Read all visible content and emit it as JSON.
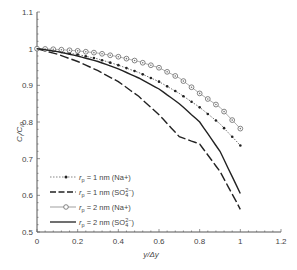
{
  "chart_data": {
    "type": "line",
    "title": "",
    "xlabel": "y/Δy",
    "ylabel": "C_i/C_i0",
    "xlim": [
      0,
      1.2
    ],
    "ylim": [
      0.5,
      1.1
    ],
    "xticks": [
      "0",
      "0.2",
      "0.4",
      "0.6",
      "0.8",
      "1",
      "1.2"
    ],
    "yticks": [
      "0.5",
      "0.6",
      "0.7",
      "0.8",
      "0.9",
      "1",
      "1.1"
    ],
    "grid": false,
    "legend_position": "lower left",
    "x": [
      0,
      0.1,
      0.2,
      0.3,
      0.4,
      0.5,
      0.6,
      0.7,
      0.8,
      0.9,
      1.0
    ],
    "series": [
      {
        "name": "r_p = 1 nm (Na+)",
        "style": "dotted-filled-dots",
        "values": [
          1.0,
          0.993,
          0.984,
          0.972,
          0.955,
          0.935,
          0.91,
          0.878,
          0.84,
          0.795,
          0.736
        ]
      },
      {
        "name": "r_p = 1 nm (SO4 2-)",
        "style": "dashed",
        "values": [
          1.0,
          0.985,
          0.965,
          0.94,
          0.91,
          0.87,
          0.82,
          0.76,
          0.74,
          0.665,
          0.562
        ]
      },
      {
        "name": "r_p = 2 nm (Na+)",
        "style": "open-circles",
        "values": [
          1.0,
          0.998,
          0.994,
          0.988,
          0.978,
          0.965,
          0.948,
          0.92,
          0.878,
          0.84,
          0.782
        ]
      },
      {
        "name": "r_p = 2 nm (SO4 2-)",
        "style": "solid",
        "values": [
          1.0,
          0.992,
          0.98,
          0.965,
          0.945,
          0.92,
          0.89,
          0.85,
          0.8,
          0.72,
          0.605
        ]
      }
    ]
  },
  "legend": {
    "entries": [
      {
        "prefix": "r",
        "sub": "p",
        "text": " = 1 nm (Na+)",
        "ion": ""
      },
      {
        "prefix": "r",
        "sub": "p",
        "text": " = 1 nm (SO",
        "ion": "SO4 2-"
      },
      {
        "prefix": "r",
        "sub": "p",
        "text": " = 2 nm (Na+)",
        "ion": ""
      },
      {
        "prefix": "r",
        "sub": "p",
        "text": " = 2 nm (SO",
        "ion": "SO4 2-"
      }
    ]
  }
}
